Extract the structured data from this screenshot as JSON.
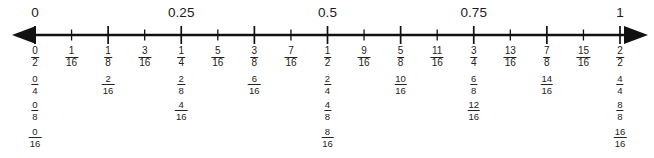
{
  "figure": {
    "axis": {
      "start_decimal": "0",
      "end_decimal": "1",
      "left_arrow": "left-arrow",
      "right_arrow": "right-arrow",
      "tick_count": 17,
      "line_color": "#111111",
      "text_color": "#232323"
    },
    "decimal_labels": [
      {
        "text": "0",
        "position": 0
      },
      {
        "text": "0.25",
        "position": 0.25
      },
      {
        "text": "0.5",
        "position": 0.5
      },
      {
        "text": "0.75",
        "position": 0.75
      },
      {
        "text": "1",
        "position": 1
      }
    ],
    "rows": [
      {
        "name": "sixteenths-row",
        "step": 0.0625,
        "fractions": [
          {
            "numerator": "0",
            "denominator": "2",
            "position": 0
          },
          {
            "numerator": "1",
            "denominator": "16",
            "position": 0.0625
          },
          {
            "numerator": "1",
            "denominator": "8",
            "position": 0.125
          },
          {
            "numerator": "3",
            "denominator": "16",
            "position": 0.1875
          },
          {
            "numerator": "1",
            "denominator": "4",
            "position": 0.25
          },
          {
            "numerator": "5",
            "denominator": "16",
            "position": 0.3125
          },
          {
            "numerator": "3",
            "denominator": "8",
            "position": 0.375
          },
          {
            "numerator": "7",
            "denominator": "16",
            "position": 0.4375
          },
          {
            "numerator": "1",
            "denominator": "2",
            "position": 0.5
          },
          {
            "numerator": "9",
            "denominator": "16",
            "position": 0.5625
          },
          {
            "numerator": "5",
            "denominator": "8",
            "position": 0.625
          },
          {
            "numerator": "11",
            "denominator": "16",
            "position": 0.6875
          },
          {
            "numerator": "3",
            "denominator": "4",
            "position": 0.75
          },
          {
            "numerator": "13",
            "denominator": "16",
            "position": 0.8125
          },
          {
            "numerator": "7",
            "denominator": "8",
            "position": 0.875
          },
          {
            "numerator": "15",
            "denominator": "16",
            "position": 0.9375
          },
          {
            "numerator": "2",
            "denominator": "2",
            "position": 1
          }
        ]
      },
      {
        "name": "eighths-row",
        "step": 0.125,
        "fractions": [
          {
            "numerator": "0",
            "denominator": "4",
            "position": 0
          },
          {
            "numerator": "2",
            "denominator": "16",
            "position": 0.125
          },
          {
            "numerator": "2",
            "denominator": "8",
            "position": 0.25
          },
          {
            "numerator": "6",
            "denominator": "16",
            "position": 0.375
          },
          {
            "numerator": "2",
            "denominator": "4",
            "position": 0.5
          },
          {
            "numerator": "10",
            "denominator": "16",
            "position": 0.625
          },
          {
            "numerator": "6",
            "denominator": "8",
            "position": 0.75
          },
          {
            "numerator": "14",
            "denominator": "16",
            "position": 0.875
          },
          {
            "numerator": "4",
            "denominator": "4",
            "position": 1
          }
        ]
      },
      {
        "name": "quarters-row",
        "step": 0.25,
        "fractions": [
          {
            "numerator": "0",
            "denominator": "8",
            "position": 0
          },
          {
            "numerator": "4",
            "denominator": "16",
            "position": 0.25
          },
          {
            "numerator": "4",
            "denominator": "8",
            "position": 0.5
          },
          {
            "numerator": "12",
            "denominator": "16",
            "position": 0.75
          },
          {
            "numerator": "8",
            "denominator": "8",
            "position": 1
          }
        ]
      },
      {
        "name": "halves-row",
        "step": 0.5,
        "fractions": [
          {
            "numerator": "0",
            "denominator": "16",
            "position": 0
          },
          {
            "numerator": "8",
            "denominator": "16",
            "position": 0.5
          },
          {
            "numerator": "16",
            "denominator": "16",
            "position": 1
          }
        ]
      }
    ]
  },
  "chart_data": {
    "type": "line",
    "xlabel": "",
    "ylabel": "",
    "xlim": [
      0,
      1
    ],
    "grid": false,
    "legend": "none",
    "tick_labels_decimal": [
      "0",
      "0.25",
      "0.5",
      "0.75",
      "1"
    ],
    "tick_positions_decimal": [
      0,
      0.25,
      0.5,
      0.75,
      1
    ],
    "tick_positions_minor": [
      0,
      0.0625,
      0.125,
      0.1875,
      0.25,
      0.3125,
      0.375,
      0.4375,
      0.5,
      0.5625,
      0.625,
      0.6875,
      0.75,
      0.8125,
      0.875,
      0.9375,
      1
    ],
    "series": [
      {
        "name": "sixteenths-row",
        "labels": [
          "0/2",
          "1/16",
          "1/8",
          "3/16",
          "1/4",
          "5/16",
          "3/8",
          "7/16",
          "1/2",
          "9/16",
          "5/8",
          "11/16",
          "3/4",
          "13/16",
          "7/8",
          "15/16",
          "2/2"
        ],
        "values": [
          0,
          0.0625,
          0.125,
          0.1875,
          0.25,
          0.3125,
          0.375,
          0.4375,
          0.5,
          0.5625,
          0.625,
          0.6875,
          0.75,
          0.8125,
          0.875,
          0.9375,
          1
        ]
      },
      {
        "name": "eighths-row",
        "labels": [
          "0/4",
          "2/16",
          "2/8",
          "6/16",
          "2/4",
          "10/16",
          "6/8",
          "14/16",
          "4/4"
        ],
        "values": [
          0,
          0.125,
          0.25,
          0.375,
          0.5,
          0.625,
          0.75,
          0.875,
          1
        ]
      },
      {
        "name": "quarters-row",
        "labels": [
          "0/8",
          "4/16",
          "4/8",
          "12/16",
          "8/8"
        ],
        "values": [
          0,
          0.25,
          0.5,
          0.75,
          1
        ]
      },
      {
        "name": "halves-row",
        "labels": [
          "0/16",
          "8/16",
          "16/16"
        ],
        "values": [
          0,
          0.5,
          1
        ]
      }
    ]
  }
}
